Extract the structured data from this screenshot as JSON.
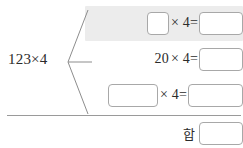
{
  "worksheet": {
    "type": "math-decomposition-worksheet",
    "language": "ko",
    "left_operand": "123×4",
    "multiplier": "4",
    "highlight_color": "#ececec",
    "text_color": "#2b2b2b",
    "box_border_color": "#a8a8a8",
    "rule_color": "#9a9a9a",
    "rows": [
      {
        "id": "row-1",
        "highlighted": true,
        "operand_value": "",
        "operand_placeholder": "",
        "operator_text": "× 4=",
        "answer_value": "",
        "answer_placeholder": ""
      },
      {
        "id": "row-2",
        "highlighted": false,
        "operand_value": "20",
        "operand_placeholder": "",
        "operator_text": "× 4=",
        "answer_value": "",
        "answer_placeholder": ""
      },
      {
        "id": "row-3",
        "highlighted": false,
        "operand_value": "",
        "operand_placeholder": "",
        "operator_text": "× 4=",
        "answer_value": "",
        "answer_placeholder": ""
      }
    ],
    "sum": {
      "label": "합",
      "value": "",
      "placeholder": ""
    }
  }
}
